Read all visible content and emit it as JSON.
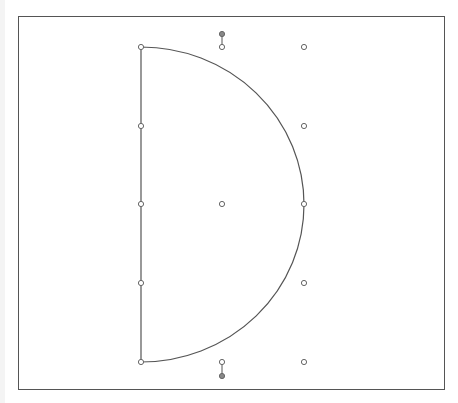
{
  "canvas": {
    "width": 458,
    "height": 403,
    "frame": {
      "x": 18,
      "y": 16,
      "width": 426,
      "height": 373,
      "stroke": "#555555"
    },
    "shape": {
      "type": "half-ellipse",
      "stroke": "#555555",
      "left_x": 141,
      "top_y": 47,
      "bottom_y": 362,
      "right_x": 304,
      "center_y": 204.5
    },
    "anchor_points": [
      {
        "name": "top-left",
        "x": 141,
        "y": 47
      },
      {
        "name": "mid-upper-left",
        "x": 141,
        "y": 126
      },
      {
        "name": "mid-left",
        "x": 141,
        "y": 204
      },
      {
        "name": "mid-lower-left",
        "x": 141,
        "y": 283
      },
      {
        "name": "bottom-left",
        "x": 141,
        "y": 362
      },
      {
        "name": "right-apex",
        "x": 304,
        "y": 204
      },
      {
        "name": "center",
        "x": 222,
        "y": 204
      }
    ],
    "control_points": [
      {
        "name": "top-right",
        "x": 304,
        "y": 47
      },
      {
        "name": "upper-right",
        "x": 304,
        "y": 126
      },
      {
        "name": "lower-right",
        "x": 304,
        "y": 283
      },
      {
        "name": "bottom-right",
        "x": 304,
        "y": 362
      },
      {
        "name": "top-handle-base",
        "x": 222,
        "y": 47
      },
      {
        "name": "bottom-handle-base",
        "x": 222,
        "y": 362
      }
    ],
    "rotation_handles": [
      {
        "name": "top-rotation-handle",
        "x": 222,
        "y": 34,
        "base_y": 47
      },
      {
        "name": "bottom-rotation-handle",
        "x": 222,
        "y": 376,
        "base_y": 362
      }
    ],
    "colors": {
      "point_fill": "#ffffff",
      "point_stroke": "#666666",
      "handle_fill": "#888888",
      "background": "#ffffff"
    }
  }
}
